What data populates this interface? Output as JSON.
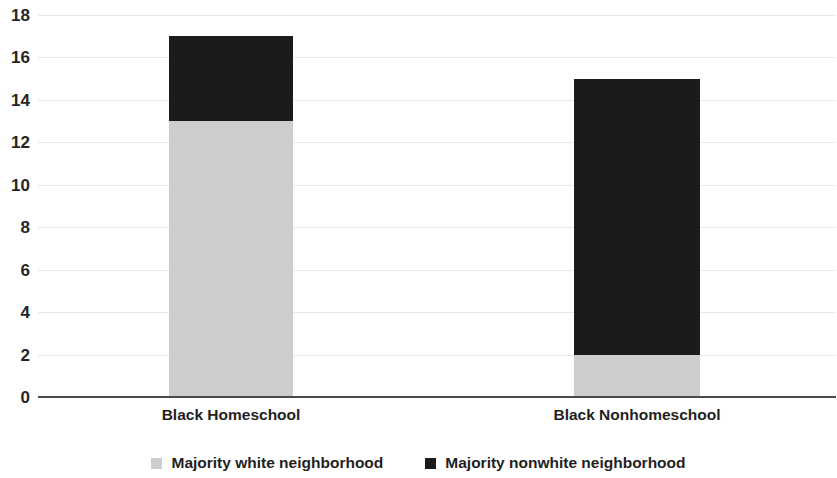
{
  "chart_data": {
    "type": "bar",
    "subtype": "stacked-vertical",
    "title": "",
    "subtitle": "",
    "xlabel": "",
    "ylabel": "",
    "categories": [
      "Black Homeschool",
      "Black Nonhomeschool"
    ],
    "series": [
      {
        "name": "Majority white neighborhood",
        "color": "#cdcdcd",
        "values": [
          13,
          2
        ]
      },
      {
        "name": "Majority nonwhite neighborhood",
        "color": "#1b1b1b",
        "values": [
          4,
          13
        ]
      }
    ],
    "totals": [
      17,
      15
    ],
    "ylim": [
      0,
      18
    ],
    "ytick_step": 2,
    "ytick_labels": [
      "0",
      "2",
      "4",
      "6",
      "8",
      "10",
      "12",
      "14",
      "16",
      "18"
    ],
    "grid": true,
    "grid_axis": "y",
    "grid_color": "#e9e9e9",
    "axis_line_color": "#4a4a4a",
    "legend_position": "bottom",
    "annotations": []
  },
  "legend": {
    "entries": [
      {
        "label": "Majority white neighborhood",
        "swatch_color": "#cdcdcd",
        "swatch_name": "legend-swatch-majority-white"
      },
      {
        "label": "Majority nonwhite neighborhood",
        "swatch_color": "#1b1b1b",
        "swatch_name": "legend-swatch-majority-nonwhite"
      }
    ]
  }
}
